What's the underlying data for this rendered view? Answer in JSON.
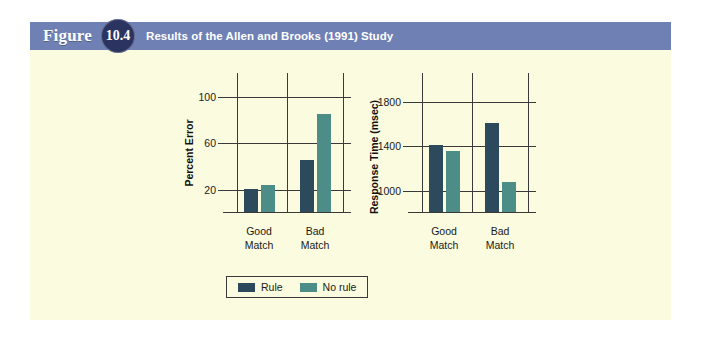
{
  "figure": {
    "label_word": "Figure",
    "number": "10.4",
    "title": "Results of the Allen and Brooks (1991) Study",
    "header_color": "#6f80b5",
    "badge_color": "#2b3360",
    "panel_color": "#fbfbdf"
  },
  "legend": {
    "entries": [
      {
        "label": "Rule",
        "color": "#2c4a5b"
      },
      {
        "label": "No rule",
        "color": "#4d8d87"
      }
    ]
  },
  "chart_data": [
    {
      "id": "percent-error",
      "type": "bar",
      "title": "",
      "xlabel": "",
      "ylabel": "Percent Error",
      "categories": [
        "Good Match",
        "Bad Match"
      ],
      "category_lines": [
        [
          "Good",
          "Match"
        ],
        [
          "Bad",
          "Match"
        ]
      ],
      "yticks": [
        20,
        60,
        100
      ],
      "ylim": [
        0,
        110
      ],
      "grid": true,
      "legend_position": "bottom-center",
      "series": [
        {
          "name": "Rule",
          "color": "#2c4a5b",
          "values": [
            20,
            45
          ]
        },
        {
          "name": "No rule",
          "color": "#4d8d87",
          "values": [
            23,
            84
          ]
        }
      ]
    },
    {
      "id": "response-time",
      "type": "bar",
      "title": "",
      "xlabel": "",
      "ylabel": "Response Time (msec)",
      "categories": [
        "Good Match",
        "Bad Match"
      ],
      "category_lines": [
        [
          "Good",
          "Match"
        ],
        [
          "Bad",
          "Match"
        ]
      ],
      "yticks": [
        1000,
        1400,
        1800
      ],
      "ylim": [
        800,
        1950
      ],
      "grid": true,
      "legend_position": "bottom-center",
      "series": [
        {
          "name": "Rule",
          "color": "#2c4a5b",
          "values": [
            1400,
            1600
          ]
        },
        {
          "name": "No rule",
          "color": "#4d8d87",
          "values": [
            1350,
            1070
          ]
        }
      ]
    }
  ]
}
